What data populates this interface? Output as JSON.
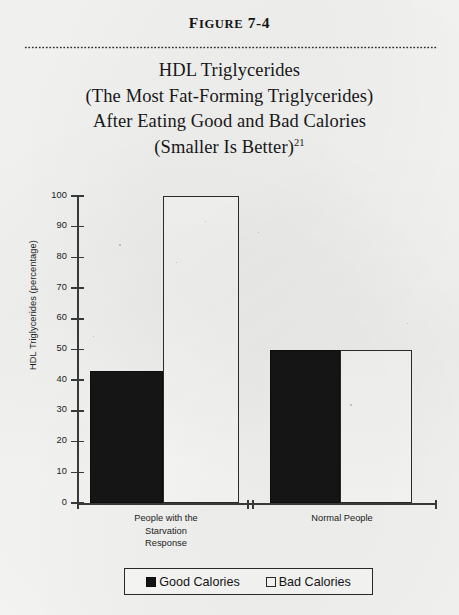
{
  "figure": {
    "label_lead": "F",
    "label_rest": "IGURE",
    "label_number": "7-4",
    "title_lines": [
      "HDL Triglycerides",
      "(The Most Fat-Forming Triglycerides)",
      "After Eating Good and Bad Calories",
      "(Smaller Is Better)"
    ],
    "title_superscript": "21"
  },
  "chart_data": {
    "type": "bar",
    "title": "HDL Triglycerides (The Most Fat-Forming Triglycerides) After Eating Good and Bad Calories (Smaller Is Better)",
    "xlabel": "",
    "ylabel": "HDL Triglycerides (percentage)",
    "ylim": [
      0,
      100
    ],
    "yticks": [
      0,
      10,
      20,
      30,
      40,
      50,
      60,
      70,
      80,
      90,
      100
    ],
    "ytick_labels": [
      "0",
      "10",
      "20",
      "30",
      "40",
      "50",
      "60",
      "70",
      "80",
      "90",
      "100"
    ],
    "grid": false,
    "legend_position": "bottom",
    "categories": [
      "People with the Starvation Response",
      "Normal People"
    ],
    "category_label_lines": [
      [
        "People with the",
        "Starvation",
        "Response"
      ],
      [
        "Normal People"
      ]
    ],
    "series": [
      {
        "name": "Good Calories",
        "values": [
          43,
          50
        ],
        "color": "#141414",
        "style": "filled"
      },
      {
        "name": "Bad Calories",
        "values": [
          100,
          50
        ],
        "color": "#fbfbf9",
        "style": "outlined"
      }
    ]
  },
  "legend": {
    "entries": [
      {
        "label": "Good Calories",
        "swatch": "filled-black-square"
      },
      {
        "label": "Bad Calories",
        "swatch": "open-white-square"
      }
    ]
  }
}
